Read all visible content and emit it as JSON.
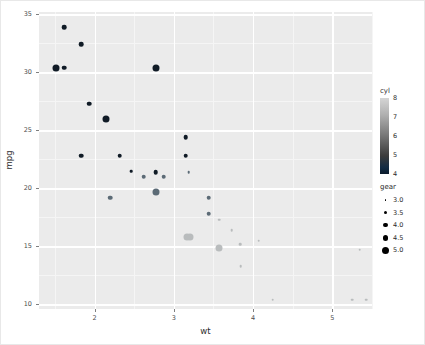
{
  "chart_data": {
    "type": "scatter",
    "title": "",
    "xlabel": "wt",
    "ylabel": "mpg",
    "xlim": [
      1.3,
      5.5
    ],
    "ylim": [
      9.6,
      35.2
    ],
    "x_ticks": [
      "2",
      "3",
      "4",
      "5"
    ],
    "x_tick_values": [
      2,
      3,
      4,
      5
    ],
    "y_ticks": [
      "10",
      "15",
      "20",
      "25",
      "30",
      "35"
    ],
    "y_tick_values": [
      10,
      15,
      20,
      25,
      30,
      35
    ],
    "grid": "major white gridlines on grey panel",
    "panel_background": "#ebebeb",
    "legend_position": "right",
    "encodings": {
      "x": "wt",
      "y": "mpg",
      "color": "cyl",
      "size": "gear"
    },
    "points": [
      {
        "x": 1.615,
        "y": 33.9,
        "cyl": 4,
        "gear": 4
      },
      {
        "x": 1.835,
        "y": 32.4,
        "cyl": 4,
        "gear": 4
      },
      {
        "x": 1.513,
        "y": 30.4,
        "cyl": 4,
        "gear": 5
      },
      {
        "x": 1.615,
        "y": 30.4,
        "cyl": 4,
        "gear": 4
      },
      {
        "x": 1.935,
        "y": 27.3,
        "cyl": 4,
        "gear": 4
      },
      {
        "x": 2.14,
        "y": 26.0,
        "cyl": 4,
        "gear": 5
      },
      {
        "x": 3.15,
        "y": 24.4,
        "cyl": 4,
        "gear": 4
      },
      {
        "x": 2.32,
        "y": 22.8,
        "cyl": 4,
        "gear": 4
      },
      {
        "x": 3.15,
        "y": 22.8,
        "cyl": 4,
        "gear": 4
      },
      {
        "x": 2.465,
        "y": 21.5,
        "cyl": 4,
        "gear": 3
      },
      {
        "x": 2.77,
        "y": 21.4,
        "cyl": 4,
        "gear": 4
      },
      {
        "x": 2.62,
        "y": 21.0,
        "cyl": 6,
        "gear": 4
      },
      {
        "x": 2.875,
        "y": 21.0,
        "cyl": 6,
        "gear": 4
      },
      {
        "x": 3.19,
        "y": 21.4,
        "cyl": 6,
        "gear": 3
      },
      {
        "x": 2.77,
        "y": 19.7,
        "cyl": 6,
        "gear": 5
      },
      {
        "x": 3.44,
        "y": 19.2,
        "cyl": 6,
        "gear": 4
      },
      {
        "x": 3.44,
        "y": 17.8,
        "cyl": 6,
        "gear": 4
      },
      {
        "x": 3.57,
        "y": 17.3,
        "cyl": 8,
        "gear": 3
      },
      {
        "x": 3.21,
        "y": 15.8,
        "cyl": 8,
        "gear": 5
      },
      {
        "x": 3.57,
        "y": 14.9,
        "cyl": 8,
        "gear": 5
      },
      {
        "x": 3.73,
        "y": 16.4,
        "cyl": 8,
        "gear": 3
      },
      {
        "x": 4.07,
        "y": 15.5,
        "cyl": 8,
        "gear": 3
      },
      {
        "x": 5.25,
        "y": 10.4,
        "cyl": 8,
        "gear": 3
      },
      {
        "x": 5.424,
        "y": 10.4,
        "cyl": 8,
        "gear": 3
      },
      {
        "x": 5.345,
        "y": 14.7,
        "cyl": 8,
        "gear": 3
      },
      {
        "x": 3.84,
        "y": 15.2,
        "cyl": 8,
        "gear": 3
      },
      {
        "x": 3.845,
        "y": 13.3,
        "cyl": 8,
        "gear": 3
      },
      {
        "x": 4.25,
        "y": 10.4,
        "cyl": 8,
        "gear": 3
      },
      {
        "x": 2.2,
        "y": 19.2,
        "cyl": 6,
        "gear": 4
      },
      {
        "x": 1.835,
        "y": 22.8,
        "cyl": 4,
        "gear": 4
      },
      {
        "x": 2.78,
        "y": 30.4,
        "cyl": 4,
        "gear": 5
      },
      {
        "x": 3.17,
        "y": 15.8,
        "cyl": 8,
        "gear": 5
      }
    ]
  },
  "axes": {
    "x_title": "wt",
    "y_title": "mpg",
    "x_tick_labels": [
      "2",
      "3",
      "4",
      "5"
    ],
    "y_tick_labels": [
      "10",
      "15",
      "20",
      "25",
      "30",
      "35"
    ]
  },
  "legends": {
    "color": {
      "title": "cyl",
      "tick_labels": [
        "8",
        "7",
        "6",
        "5",
        "4"
      ],
      "high_color": "#d5d5d5",
      "low_color": "#132b43"
    },
    "size": {
      "title": "gear",
      "entries": [
        {
          "label": "3.0",
          "diameter_px": 1.8
        },
        {
          "label": "3.5",
          "diameter_px": 3.0
        },
        {
          "label": "4.0",
          "diameter_px": 4.4
        },
        {
          "label": "4.5",
          "diameter_px": 5.8
        },
        {
          "label": "5.0",
          "diameter_px": 7.4
        }
      ],
      "key_color": "#000000"
    }
  }
}
